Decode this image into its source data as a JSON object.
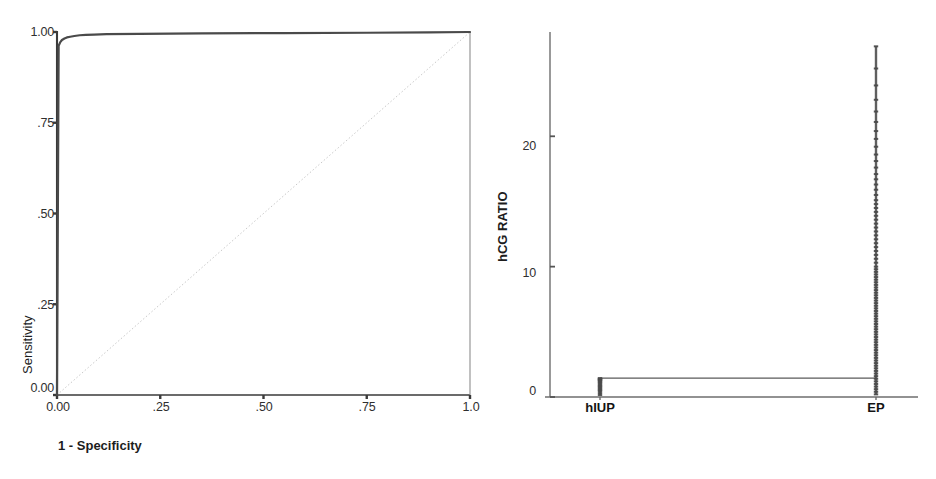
{
  "figure": {
    "background": "#ffffff",
    "ink_color": "#3a3a3a",
    "panel_count": 2
  },
  "chart_data": [
    {
      "id": "roc-curve",
      "type": "line",
      "title": "",
      "subtitle": "",
      "xlabel": "1 - Specificity",
      "ylabel": "Sensitivity",
      "xlim": [
        0,
        1
      ],
      "ylim": [
        0,
        1
      ],
      "grid": false,
      "legend": null,
      "xticks": [
        0,
        0.25,
        0.5,
        0.75,
        1.0
      ],
      "xticklabels": [
        "0.00",
        ".25",
        ".50",
        ".75",
        "1.0"
      ],
      "yticks": [
        0,
        0.25,
        0.5,
        0.75,
        1.0
      ],
      "yticklabels": [
        "0.00",
        ".25",
        ".50",
        ".75",
        "1.00"
      ],
      "series": [
        {
          "name": "ROC curve",
          "color": "#4a4a4a",
          "x": [
            0,
            0.004,
            0.008,
            0.012,
            0.018,
            0.024,
            0.032,
            0.042,
            0.055,
            0.07,
            0.09,
            0.12,
            0.2,
            0.35,
            0.55,
            0.75,
            0.9,
            1.0
          ],
          "y": [
            0.0,
            0.962,
            0.972,
            0.978,
            0.982,
            0.985,
            0.987,
            0.989,
            0.991,
            0.992,
            0.993,
            0.994,
            0.995,
            0.996,
            0.997,
            0.998,
            0.999,
            1.0
          ]
        },
        {
          "name": "Reference diagonal",
          "color": "#c9c9c9",
          "x": [
            0,
            1
          ],
          "y": [
            0,
            1
          ]
        }
      ]
    },
    {
      "id": "hcg-ratio-dotplot",
      "type": "scatter",
      "title": "",
      "subtitle": "",
      "xlabel": "",
      "ylabel": "hCG RATIO",
      "categories": [
        "hIUP",
        "EP"
      ],
      "ylim": [
        0,
        28
      ],
      "grid": false,
      "legend": null,
      "yticks": [
        0,
        10,
        20
      ],
      "yticklabels": [
        "0",
        "10",
        "20"
      ],
      "series": [
        {
          "name": "hIUP",
          "category": "hIUP",
          "color": "#4a4a4a",
          "marker": "tick",
          "values": [
            0.15,
            0.3,
            0.45,
            0.55,
            0.65,
            0.75,
            0.85,
            0.95,
            1.05,
            1.15,
            1.25,
            1.3,
            1.35,
            1.4,
            1.45
          ]
        },
        {
          "name": "EP",
          "category": "EP",
          "color": "#4a4a4a",
          "marker": "tick",
          "values": [
            0.2,
            0.4,
            0.6,
            0.8,
            1.0,
            1.2,
            1.4,
            1.6,
            1.8,
            2.0,
            2.2,
            2.4,
            2.6,
            2.8,
            3.0,
            3.2,
            3.4,
            3.6,
            3.8,
            4.0,
            4.2,
            4.4,
            4.6,
            4.8,
            5.0,
            5.2,
            5.4,
            5.6,
            5.8,
            6.0,
            6.2,
            6.4,
            6.6,
            6.8,
            7.0,
            7.2,
            7.4,
            7.6,
            7.8,
            8.0,
            8.2,
            8.4,
            8.6,
            8.8,
            9.0,
            9.2,
            9.4,
            9.6,
            9.8,
            10.0,
            10.3,
            10.6,
            10.9,
            11.2,
            11.5,
            11.8,
            12.1,
            12.4,
            12.7,
            13.0,
            13.3,
            13.6,
            13.9,
            14.2,
            14.5,
            14.8,
            15.1,
            15.5,
            15.9,
            16.3,
            16.7,
            17.1,
            17.6,
            18.1,
            18.6,
            19.2,
            19.8,
            20.4,
            21.1,
            21.9,
            22.8,
            23.9,
            25.2,
            26.9
          ]
        }
      ],
      "median_lines": [
        {
          "category": "hIUP",
          "value": 1.45
        },
        {
          "category": "EP",
          "value": 1.45
        }
      ]
    }
  ],
  "roc_panel": {
    "name": "ROC plot",
    "y_axis_title": "Sensitivity",
    "x_axis_title": "1 - Specificity",
    "y_ticks": [
      {
        "label": "1.00",
        "value": 1.0
      },
      {
        "label": ".75",
        "value": 0.75
      },
      {
        "label": ".50",
        "value": 0.5
      },
      {
        "label": ".25",
        "value": 0.25
      },
      {
        "label": "0.00",
        "value": 0.0
      }
    ],
    "x_ticks": [
      {
        "label": "0.00",
        "value": 0.0
      },
      {
        "label": ".25",
        "value": 0.25
      },
      {
        "label": ".50",
        "value": 0.5
      },
      {
        "label": ".75",
        "value": 0.75
      },
      {
        "label": "1.0",
        "value": 1.0
      }
    ]
  },
  "dot_panel": {
    "name": "hCG ratio dot plot",
    "y_axis_title": "hCG RATIO",
    "y_ticks": [
      {
        "label": "20",
        "value": 20
      },
      {
        "label": "10",
        "value": 10
      },
      {
        "label": "0",
        "value": 0
      }
    ],
    "categories": [
      {
        "label": "hIUP",
        "value": "hIUP"
      },
      {
        "label": "EP",
        "value": "EP"
      }
    ]
  }
}
